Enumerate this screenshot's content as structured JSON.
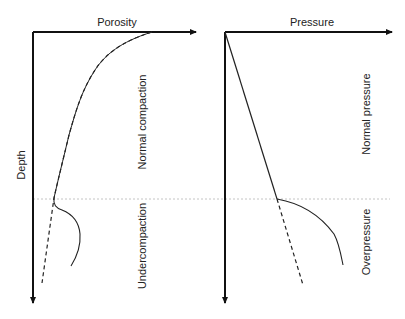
{
  "diagram": {
    "left_panel": {
      "x_axis_label": "Porosity",
      "y_axis_label": "Depth",
      "upper_zone_label": "Normal compaction",
      "lower_zone_label": "Undercompaction"
    },
    "right_panel": {
      "x_axis_label": "Pressure",
      "upper_zone_label": "Normal pressure",
      "lower_zone_label": "Overpressure"
    },
    "colors": {
      "axis": "#111111",
      "curve": "#222222",
      "boundary": "#bbbbbb"
    }
  }
}
